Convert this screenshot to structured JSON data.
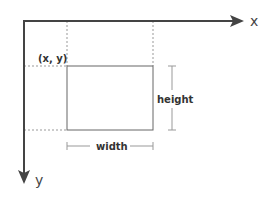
{
  "diagram": {
    "type": "coordinate-rectangle",
    "axes": {
      "x_label": "x",
      "y_label": "y",
      "color": "#444444"
    },
    "rect": {
      "origin_label": "(x, y)",
      "width_label": "width",
      "height_label": "height",
      "stroke": "#666666"
    },
    "guide_color": "#999999"
  }
}
